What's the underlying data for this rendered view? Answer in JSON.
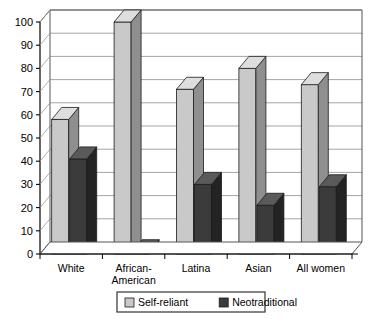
{
  "chart_data": {
    "type": "bar",
    "title": "",
    "subtitle": "",
    "xlabel": "",
    "ylabel": "",
    "ylim": [
      0,
      100
    ],
    "yticks": [
      0,
      10,
      20,
      30,
      40,
      50,
      60,
      70,
      80,
      90,
      100
    ],
    "ytick_labels": [
      "0",
      "10",
      "20",
      "30",
      "40",
      "50",
      "60",
      "70",
      "80",
      "90",
      "100"
    ],
    "grid": true,
    "grid_axis": "y",
    "legend_position": "bottom",
    "style": "3d-columns",
    "categories": [
      "White",
      "African-American",
      "Latina",
      "Asian",
      "All women"
    ],
    "category_label_lines": [
      [
        "White"
      ],
      [
        "African-",
        "American"
      ],
      [
        "Latina"
      ],
      [
        "Asian"
      ],
      [
        "All women"
      ]
    ],
    "series": [
      {
        "name": "Self-reliant",
        "color": "#c9c9c9",
        "side_color": "#8f8f8f",
        "top_color": "#dedede",
        "values": [
          58,
          100,
          71,
          80,
          73
        ]
      },
      {
        "name": "Neotraditional",
        "color": "#3b3b3b",
        "side_color": "#232323",
        "top_color": "#5a5a5a",
        "values": [
          41,
          1,
          30,
          21,
          29
        ]
      }
    ],
    "legend_entries": [
      {
        "label": "Self-reliant",
        "color": "#c9c9c9"
      },
      {
        "label": "Neotraditional",
        "color": "#3b3b3b"
      }
    ],
    "colors": {
      "axis": "#000000",
      "grid": "#9a9a9a",
      "plot_background": "#ffffff",
      "frame": "#555555",
      "legend_border": "#333333"
    }
  }
}
